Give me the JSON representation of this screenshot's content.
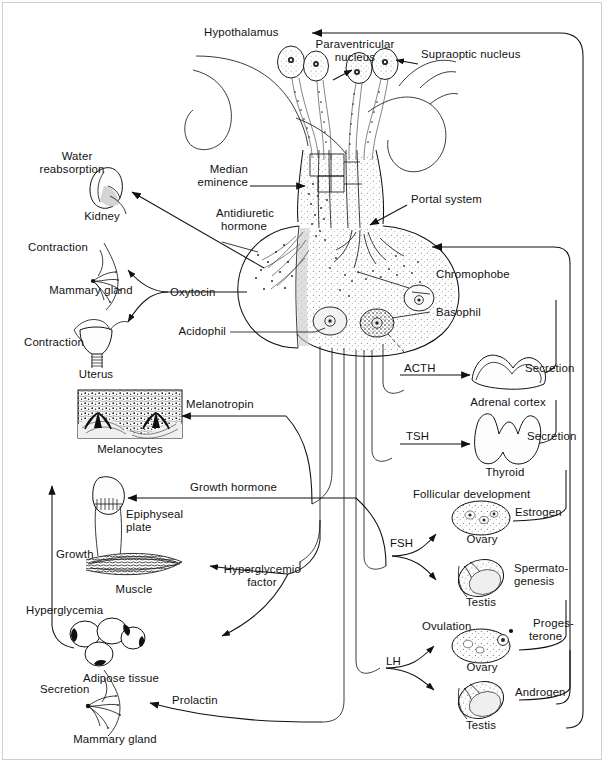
{
  "diagram": {
    "ink_color": "#111111",
    "background": "#ffffff"
  },
  "hypothalamus": {
    "label": "Hypothalamus",
    "paraventricular_nucleus": "Paraventricular\nnucleus",
    "paraventricular_nucleus_line1": "Paraventricular",
    "paraventricular_nucleus_line2": "nucleus",
    "supraoptic_nucleus": "Supraoptic nucleus",
    "median_eminence_line1": "Median",
    "median_eminence_line2": "eminence",
    "portal_system": "Portal system"
  },
  "pituitary": {
    "cells": {
      "chromophobe": "Chromophobe",
      "basophil": "Basophil",
      "acidophil": "Acidophil"
    }
  },
  "posterior_hormones": [
    {
      "hormone_line1": "Antidiuretic",
      "hormone_line2": "hormone",
      "effect": "Water\nreabsorption",
      "effect_line1": "Water",
      "effect_line2": "reabsorption",
      "target": "Kidney"
    },
    {
      "hormone": "Oxytocin",
      "effect": "Contraction",
      "target": "Mammary gland"
    },
    {
      "hormone": "Oxytocin",
      "effect": "Contraction",
      "target": "Uterus"
    }
  ],
  "anterior_hormones_left": [
    {
      "hormone": "Melanotropin",
      "effect": "",
      "target": "Melanocytes"
    },
    {
      "hormone": "Growth hormone",
      "effect": "Growth",
      "target": "Epiphyseal\nplate",
      "target_line1": "Epiphyseal",
      "target_line2": "plate"
    },
    {
      "hormone": "Hyperglycemic\nfactor",
      "hormone_line1": "Hyperglycemic",
      "hormone_line2": "factor",
      "effect": "Hyperglycemia",
      "target": "Muscle",
      "target2": "Adipose tissue"
    },
    {
      "hormone": "Prolactin",
      "effect": "Secretion",
      "target": "Mammary gland"
    }
  ],
  "anterior_hormones_right": [
    {
      "hormone": "ACTH",
      "target": "Adrenal cortex",
      "feedback": "Secretion"
    },
    {
      "hormone": "TSH",
      "target": "Thyroid",
      "feedback": "Secretion"
    },
    {
      "hormone": "FSH",
      "effect_female": "Follicular development",
      "target_female": "Ovary",
      "feedback_female": "Estrogen",
      "effect_male": "Spermato-\ngenesis",
      "effect_male_line1": "Spermato-",
      "effect_male_line2": "genesis",
      "target_male": "Testis"
    },
    {
      "hormone": "LH",
      "effect_female": "Ovulation",
      "target_female": "Ovary",
      "feedback_female": "Proges-\nterone",
      "feedback_female_line1": "Proges-",
      "feedback_female_line2": "terone",
      "target_male": "Testis",
      "feedback_male": "Androgen"
    }
  ],
  "labels": {
    "hypothalamus": "Hypothalamus",
    "paraventricular_1": "Paraventricular",
    "paraventricular_2": "nucleus",
    "supraoptic": "Supraoptic nucleus",
    "median_1": "Median",
    "median_2": "eminence",
    "portal_system": "Portal system",
    "antidiuretic_1": "Antidiuretic",
    "antidiuretic_2": "hormone",
    "water_1": "Water",
    "water_2": "reabsorption",
    "kidney": "Kidney",
    "contraction_mammary": "Contraction",
    "mammary_gland_top": "Mammary gland",
    "oxytocin": "Oxytocin",
    "contraction_uterus": "Contraction",
    "uterus": "Uterus",
    "acidophil": "Acidophil",
    "chromophobe": "Chromophobe",
    "basophil": "Basophil",
    "melanotropin": "Melanotropin",
    "melanocytes": "Melanocytes",
    "growth_hormone": "Growth hormone",
    "epiphyseal_1": "Epiphyseal",
    "epiphyseal_2": "plate",
    "growth": "Growth",
    "muscle": "Muscle",
    "hyperglycemic_1": "Hyperglycemic",
    "hyperglycemic_2": "factor",
    "hyperglycemia": "Hyperglycemia",
    "adipose_tissue": "Adipose tissue",
    "secretion_mammary": "Secretion",
    "prolactin": "Prolactin",
    "mammary_gland_bottom": "Mammary gland",
    "acth": "ACTH",
    "adrenal_cortex": "Adrenal cortex",
    "secretion_adrenal": "Secretion",
    "tsh": "TSH",
    "thyroid": "Thyroid",
    "secretion_thyroid": "Secretion",
    "follicular_development": "Follicular development",
    "estrogen": "Estrogen",
    "ovary_fsh": "Ovary",
    "fsh": "FSH",
    "spermato_1": "Spermato-",
    "spermato_2": "genesis",
    "testis_fsh": "Testis",
    "ovulation": "Ovulation",
    "progesterone_1": "Proges-",
    "progesterone_2": "terone",
    "ovary_lh": "Ovary",
    "lh": "LH",
    "androgen": "Androgen",
    "testis_lh": "Testis"
  }
}
